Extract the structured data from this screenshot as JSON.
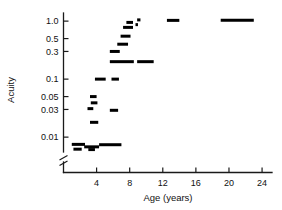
{
  "chart_data": {
    "type": "scatter",
    "title": "",
    "xlabel": "Age (years)",
    "ylabel": "Acuity",
    "xlim": [
      0,
      25.2
    ],
    "ylim_log": [
      0.006,
      1.25
    ],
    "xticks": [
      4,
      8,
      12,
      16,
      20,
      24
    ],
    "xtick_labels": [
      "4",
      "8",
      "12",
      "16",
      "20",
      "24"
    ],
    "yticks": [
      1.0,
      0.5,
      0.3,
      0.1,
      0.05,
      0.03,
      0.01
    ],
    "ytick_labels": [
      "1.0",
      "0.5",
      "0.3",
      "0.1",
      "0.05",
      "0.03",
      "0.01"
    ],
    "yscale": "log",
    "grid": false,
    "legend": null,
    "axis_break": {
      "axis": "y",
      "present": true,
      "note": "break symbol on y-axis below 0.01"
    },
    "marker_style": "horizontal-bar-segment",
    "series": [
      {
        "name": "Acuity vs Age",
        "segments": [
          {
            "x_start": 1.0,
            "x_end": 2.6,
            "y": 0.0075
          },
          {
            "x_start": 1.2,
            "x_end": 2.2,
            "y": 0.0062
          },
          {
            "x_start": 2.5,
            "x_end": 4.3,
            "y": 0.0068
          },
          {
            "x_start": 3.0,
            "x_end": 3.8,
            "y": 0.0061
          },
          {
            "x_start": 4.3,
            "x_end": 7.0,
            "y": 0.0074
          },
          {
            "x_start": 3.2,
            "x_end": 4.2,
            "y": 0.018
          },
          {
            "x_start": 2.9,
            "x_end": 3.6,
            "y": 0.031
          },
          {
            "x_start": 3.3,
            "x_end": 4.1,
            "y": 0.039
          },
          {
            "x_start": 3.2,
            "x_end": 4.0,
            "y": 0.05
          },
          {
            "x_start": 5.6,
            "x_end": 6.6,
            "y": 0.029
          },
          {
            "x_start": 3.8,
            "x_end": 5.1,
            "y": 0.1
          },
          {
            "x_start": 5.8,
            "x_end": 6.7,
            "y": 0.1
          },
          {
            "x_start": 5.6,
            "x_end": 8.5,
            "y": 0.2
          },
          {
            "x_start": 8.9,
            "x_end": 10.9,
            "y": 0.2
          },
          {
            "x_start": 5.6,
            "x_end": 6.8,
            "y": 0.3
          },
          {
            "x_start": 6.5,
            "x_end": 7.8,
            "y": 0.4
          },
          {
            "x_start": 6.9,
            "x_end": 8.1,
            "y": 0.55
          },
          {
            "x_start": 7.2,
            "x_end": 8.4,
            "y": 0.78
          },
          {
            "x_start": 7.6,
            "x_end": 8.4,
            "y": 0.95
          },
          {
            "x_start": 8.9,
            "x_end": 9.3,
            "y": 1.05
          },
          {
            "x_start": 8.7,
            "x_end": 9.0,
            "y": 0.87
          },
          {
            "x_start": 12.5,
            "x_end": 14.0,
            "y": 1.03
          },
          {
            "x_start": 19.0,
            "x_end": 23.0,
            "y": 1.04
          }
        ]
      }
    ]
  }
}
